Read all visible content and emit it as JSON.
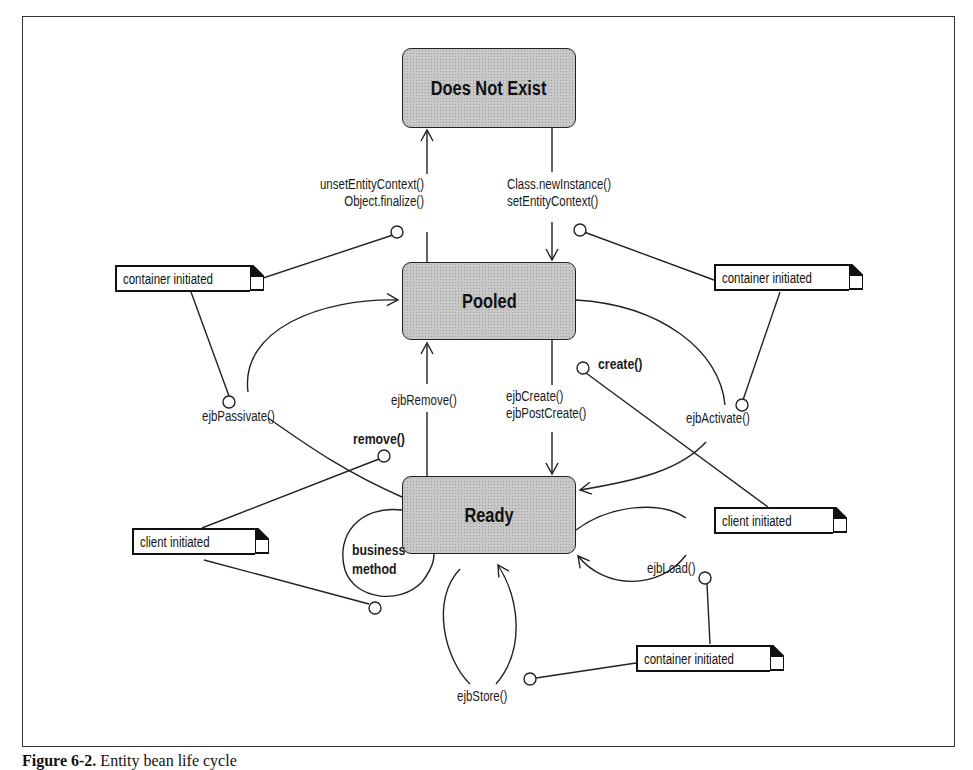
{
  "diagram": {
    "type": "state-diagram",
    "title": "Entity bean life cycle",
    "states": [
      {
        "id": "does-not-exist",
        "label": "Does Not  Exist"
      },
      {
        "id": "pooled",
        "label": "Pooled"
      },
      {
        "id": "ready",
        "label": "Ready"
      }
    ],
    "transitions": [
      {
        "from": "does-not-exist",
        "to": "pooled",
        "label_lines": [
          "Class.newInstance()",
          "setEntityContext()"
        ]
      },
      {
        "from": "pooled",
        "to": "does-not-exist",
        "label_lines": [
          "unsetEntityContext()",
          "Object.finalize()"
        ]
      },
      {
        "from": "pooled",
        "to": "ready",
        "label_lines": [
          "ejbCreate()",
          "ejbPostCreate()"
        ]
      },
      {
        "from": "ready",
        "to": "pooled",
        "label_lines": [
          "ejbRemove()"
        ]
      },
      {
        "from": "ready",
        "to": "pooled",
        "label_lines": [
          "ejbPassivate()"
        ]
      },
      {
        "from": "pooled",
        "to": "ready",
        "label_lines": [
          "ejbActivate()"
        ]
      },
      {
        "from": "ready",
        "to": "ready",
        "label_lines": [
          "business",
          "method"
        ]
      },
      {
        "from": "ready",
        "to": "ready",
        "label_lines": [
          "ejbStore()"
        ]
      },
      {
        "from": "ready",
        "to": "ready",
        "label_lines": [
          "ejbLoad()"
        ]
      }
    ],
    "triggers": {
      "create": "create()",
      "remove": "remove()"
    },
    "notes": [
      {
        "id": "note-top-left",
        "label": "container initiated"
      },
      {
        "id": "note-top-right",
        "label": "container initiated"
      },
      {
        "id": "note-client-right",
        "label": "client initiated"
      },
      {
        "id": "note-client-left",
        "label": "client initiated"
      },
      {
        "id": "note-bottom-right",
        "label": "container initiated"
      }
    ],
    "caption": {
      "number": "Figure 6-2.",
      "text": "Entity bean life cycle"
    }
  }
}
